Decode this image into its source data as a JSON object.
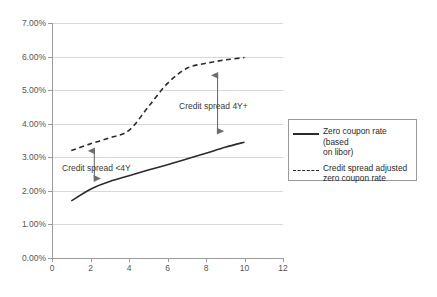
{
  "chart_data": {
    "type": "line",
    "title": "",
    "xlabel": "",
    "ylabel": "",
    "xlim": [
      0,
      12
    ],
    "ylim": [
      0,
      0.07
    ],
    "grid": true,
    "legend_position": "right",
    "x_ticks": [
      "0",
      "2",
      "4",
      "6",
      "8",
      "10",
      "12"
    ],
    "x_tick_values": [
      0,
      2,
      4,
      6,
      8,
      10,
      12
    ],
    "y_ticks": [
      "0.00%",
      "1.00%",
      "2.00%",
      "3.00%",
      "4.00%",
      "5.00%",
      "6.00%",
      "7.00%"
    ],
    "y_tick_values": [
      0.0,
      0.01,
      0.02,
      0.03,
      0.04,
      0.05,
      0.06,
      0.07
    ],
    "x": [
      1,
      2,
      3,
      4,
      5,
      6,
      7,
      8,
      9,
      10
    ],
    "series": [
      {
        "name": "Zero coupon rate (based on libor)",
        "style": "solid",
        "color": "#2b2b2b",
        "values": [
          0.017,
          0.0205,
          0.0228,
          0.0245,
          0.0262,
          0.0278,
          0.0295,
          0.0312,
          0.033,
          0.0345
        ]
      },
      {
        "name": "Credit spread adjusted zero coupon rate",
        "style": "dashed",
        "color": "#2b2b2b",
        "values": [
          0.032,
          0.034,
          0.0358,
          0.038,
          0.045,
          0.052,
          0.0565,
          0.058,
          0.059,
          0.0597
        ]
      }
    ],
    "annotations": [
      {
        "name": "credit-spread-4y-plus",
        "text": "Credit spread 4Y+",
        "arrow": {
          "x": 8.6,
          "y_top": 0.0562,
          "y_bottom": 0.036,
          "double_headed": true
        }
      },
      {
        "name": "credit-spread-lt-4y",
        "text": "Credit spread <4Y",
        "arrow": {
          "x": 2.2,
          "y_top": 0.0337,
          "y_bottom": 0.0219,
          "double_headed": true
        }
      }
    ],
    "colors": {
      "line": "#2b2b2b",
      "grid": "#d8d8d8",
      "axis": "#9a9a9a",
      "tick_label": "#555555",
      "background": "#ffffff"
    }
  },
  "legend": {
    "items": [
      {
        "label": "Zero coupon rate (based\non libor)",
        "style": "solid"
      },
      {
        "label": "Credit spread adjusted\nzero coupon rate",
        "style": "dashed"
      }
    ]
  }
}
